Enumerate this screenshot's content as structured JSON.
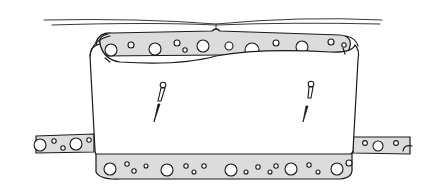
{
  "image": {
    "kind": "hand-drawn sketch",
    "subject": "fabric band wrapped around a foam cylinder, secured with two pins",
    "colors": {
      "ink": "#1a1a1a",
      "foam_fill": "#dcdcdc",
      "background": "#ffffff"
    },
    "elements": {
      "pins_count": 2,
      "top_strands": 2,
      "side_foam_extensions": 2
    }
  }
}
